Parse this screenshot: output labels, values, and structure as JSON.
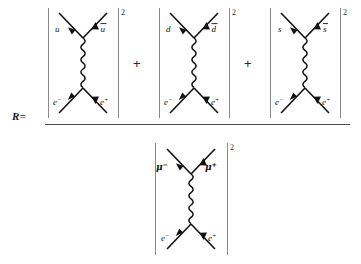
{
  "equation": {
    "lhs_symbol": "R",
    "equals_sign": "=",
    "operators": [
      "+",
      "+"
    ],
    "exponent": "2"
  },
  "numerator": {
    "terms": [
      {
        "id": "up-quark-term",
        "outgoing_left": "u",
        "outgoing_left_bar": false,
        "outgoing_right": "u",
        "outgoing_right_bar": true,
        "incoming_left": "e",
        "incoming_left_sup": "−",
        "incoming_right": "e",
        "incoming_right_sup": "+",
        "exponent": "2",
        "mediator": "photon"
      },
      {
        "id": "down-quark-term",
        "outgoing_left": "d",
        "outgoing_left_bar": false,
        "outgoing_right": "d",
        "outgoing_right_bar": true,
        "incoming_left": "e",
        "incoming_left_sup": "−",
        "incoming_right": "e",
        "incoming_right_sup": "+",
        "exponent": "2",
        "mediator": "photon"
      },
      {
        "id": "strange-quark-term",
        "outgoing_left": "s",
        "outgoing_left_bar": false,
        "outgoing_right": "s",
        "outgoing_right_bar": true,
        "incoming_left": "e",
        "incoming_left_sup": "−",
        "incoming_right": "e",
        "incoming_right_sup": "+",
        "exponent": "2",
        "mediator": "photon"
      }
    ]
  },
  "denominator": {
    "terms": [
      {
        "id": "muon-term",
        "outgoing_left": "μ",
        "outgoing_left_sup": "−",
        "outgoing_right": "μ",
        "outgoing_right_sup": "+",
        "incoming_left": "e",
        "incoming_left_sup": "−",
        "incoming_right": "e",
        "incoming_right_sup": "+",
        "exponent": "2",
        "mediator": "photon"
      }
    ]
  }
}
